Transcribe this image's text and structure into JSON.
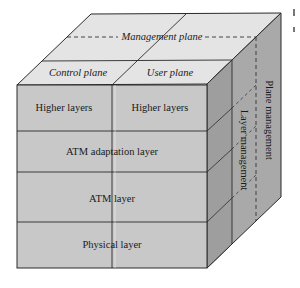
{
  "diagram": {
    "type": "ATM protocol reference model cube",
    "top_face": {
      "management_plane": "Management plane",
      "control_plane": "Control plane",
      "user_plane": "User plane"
    },
    "front_face": {
      "rows": [
        {
          "left": "Higher layers",
          "right": "Higher layers"
        },
        {
          "full": "ATM adaptation layer"
        },
        {
          "full": "ATM layer"
        },
        {
          "full": "Physical layer"
        }
      ]
    },
    "right_face": {
      "layer_management": "Layer management",
      "plane_management": "Plane management"
    },
    "colors": {
      "top_face": "#e4e4e4",
      "front_face": "#c8c8c8",
      "right_face": "#a9a9a9",
      "right_face_dark": "#9c9c9c",
      "lines": "#2a2a2a"
    }
  }
}
